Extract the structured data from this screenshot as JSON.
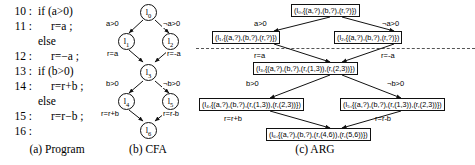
{
  "figure": {
    "captions": [
      {
        "id": "a",
        "text": "(a) Program"
      },
      {
        "id": "b",
        "text": "(b) CFA"
      },
      {
        "id": "c",
        "text": "(c) ARG"
      }
    ]
  },
  "program": {
    "lines": [
      {
        "num": "10 :",
        "code": "if (a>0)",
        "indent": 0
      },
      {
        "num": "11 :",
        "code": "r=a ;",
        "indent": 1
      },
      {
        "num": "",
        "code": "else",
        "indent": 0
      },
      {
        "num": "12 :",
        "code": "r=−a ;",
        "indent": 1
      },
      {
        "num": "13 :",
        "code": "if (b>0)",
        "indent": 0
      },
      {
        "num": "14 :",
        "code": "r=r+b ;",
        "indent": 1
      },
      {
        "num": "",
        "code": "else",
        "indent": 0
      },
      {
        "num": "15 :",
        "code": "r=r−b ;",
        "indent": 1
      },
      {
        "num": "16 :",
        "code": "",
        "indent": 0
      }
    ]
  },
  "cfa": {
    "nodes": [
      {
        "id": "l0",
        "label": "l",
        "sub": "0"
      },
      {
        "id": "l1",
        "label": "l",
        "sub": "1"
      },
      {
        "id": "l2",
        "label": "l",
        "sub": "2"
      },
      {
        "id": "l3",
        "label": "l",
        "sub": "3"
      },
      {
        "id": "l4",
        "label": "l",
        "sub": "4"
      },
      {
        "id": "l5",
        "label": "l",
        "sub": "5"
      },
      {
        "id": "l6",
        "label": "l",
        "sub": "6"
      }
    ],
    "edges": [
      {
        "from": "l0",
        "to": "l1",
        "label": "a>0"
      },
      {
        "from": "l0",
        "to": "l2",
        "label": "¬a>0"
      },
      {
        "from": "l1",
        "to": "l3",
        "label": "r=a"
      },
      {
        "from": "l2",
        "to": "l3",
        "label": "r=-a"
      },
      {
        "from": "l3",
        "to": "l4",
        "label": "b>0"
      },
      {
        "from": "l3",
        "to": "l5",
        "label": "¬b>0"
      },
      {
        "from": "l4",
        "to": "l6",
        "label": "r=r+b"
      },
      {
        "from": "l5",
        "to": "l6",
        "label": "r=r-b"
      }
    ]
  },
  "arg": {
    "nodes": [
      {
        "id": "n0",
        "text": "(l₀,{(a,?),(b,?),(r,?)})"
      },
      {
        "id": "n1",
        "text": "(l₁,{(a,?),(b,?),(r,?)})"
      },
      {
        "id": "n2",
        "text": "(l₂,{(a,?),(b,?),(r,?)})"
      },
      {
        "id": "n3",
        "text": "(l₃,{(a,?),(b,?),(r,(1,3)),(r,(2,3))})"
      },
      {
        "id": "n4",
        "text": "(l₄,{(a,?),(b,?),(r,(1,3)),(r,(2,3))})"
      },
      {
        "id": "n5",
        "text": "(l₅,{(a,?),(b,?),(r,(1,3)),(r,(2,3))})"
      },
      {
        "id": "n6",
        "text": "(l₆,{(a,?),(b,?),(r,(4,6)),(r,(5,6))})"
      }
    ],
    "edges": [
      {
        "from": "n0",
        "to": "n1",
        "label": "a>0"
      },
      {
        "from": "n0",
        "to": "n2",
        "label": "¬a>0"
      },
      {
        "from": "n1",
        "to": "n3",
        "label": "r=a"
      },
      {
        "from": "n2",
        "to": "n3",
        "label": "r=-a"
      },
      {
        "from": "n3",
        "to": "n4",
        "label": "b>0"
      },
      {
        "from": "n3",
        "to": "n5",
        "label": "¬b>0"
      },
      {
        "from": "n4",
        "to": "n6",
        "label": "r=r+b"
      },
      {
        "from": "n5",
        "to": "n6",
        "label": "r=r-b"
      }
    ]
  }
}
